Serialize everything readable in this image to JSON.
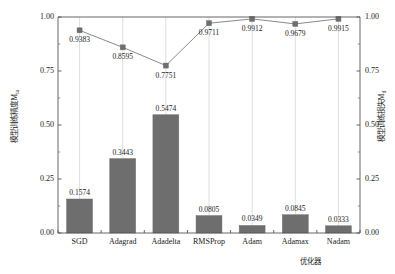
{
  "chart_data": {
    "type": "bar",
    "title": "",
    "subtitle": "",
    "xlabel": "优化器",
    "ylabel": "模型训练精度M",
    "ylabel_sub": "ta",
    "ylabel_right": "模型训练损失M",
    "ylabel_right_sub": "tl",
    "categories": [
      "SGD",
      "Adagrad",
      "Adadelta",
      "RMSProp",
      "Adam",
      "Adamax",
      "Nadam"
    ],
    "ylim": [
      0.0,
      1.0
    ],
    "ylim_right": [
      0.0,
      1.0
    ],
    "yticks": [
      "0.00",
      "0.25",
      "0.50",
      "0.75",
      "1.00"
    ],
    "ytick_values": [
      0.0,
      0.25,
      0.5,
      0.75,
      1.0
    ],
    "yticks_right": [
      "0.00",
      "0.25",
      "0.50",
      "0.75",
      "1.00"
    ],
    "ytick_values_right": [
      0.0,
      0.25,
      0.5,
      0.75,
      1.0
    ],
    "grid": "vertical",
    "legend": "none",
    "series": [
      {
        "name": "模型训练损失",
        "kind": "bar",
        "axis": "left",
        "color": "#6e6e6e",
        "values": [
          0.1574,
          0.3443,
          0.5474,
          0.0805,
          0.0349,
          0.0845,
          0.0333
        ],
        "labels": [
          "0.1574",
          "0.3443",
          "0.5474",
          "0.0805",
          "0.0349",
          "0.0845",
          "0.0333"
        ]
      },
      {
        "name": "模型训练精度",
        "kind": "line",
        "axis": "right",
        "color": "#8a8a8a",
        "marker": "square",
        "values": [
          0.9383,
          0.8595,
          0.7751,
          0.9711,
          0.9912,
          0.9679,
          0.9915
        ],
        "labels": [
          "0.9383",
          "0.8595",
          "0.7751",
          "0.9711",
          "0.9912",
          "0.9679",
          "0.9915"
        ]
      }
    ]
  }
}
